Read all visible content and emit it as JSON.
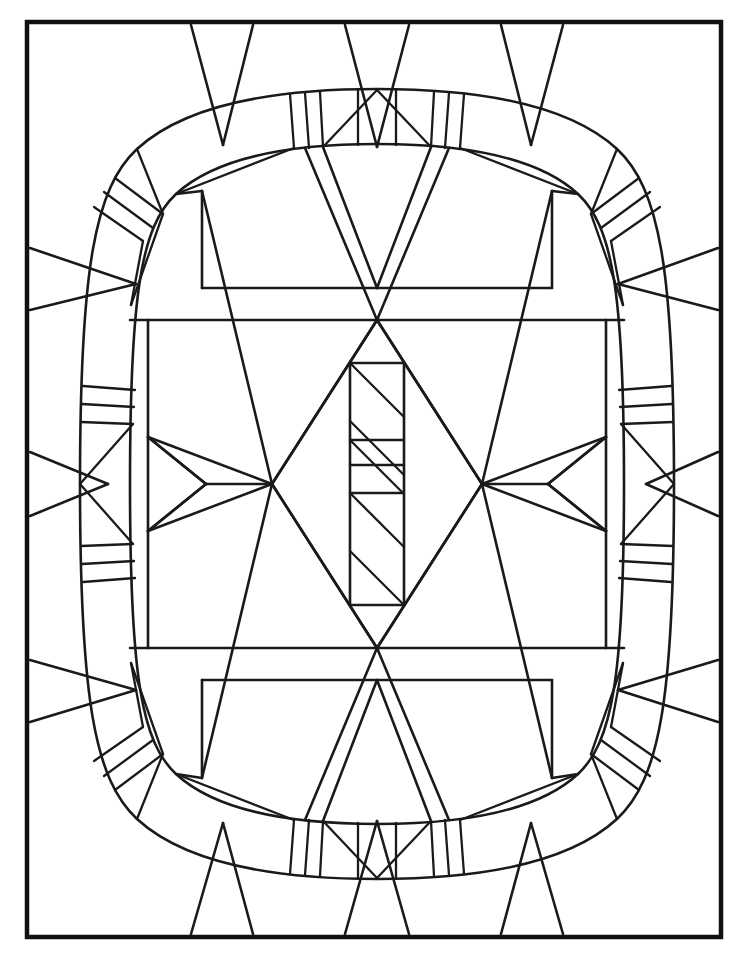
{
  "document": {
    "title": "Stained Glass Line-Art Coloring Page",
    "kind": "line-art-illustration",
    "background_color": "#ffffff",
    "line_color": "#1a1a1a",
    "frame_color": "#111111",
    "canvas": {
      "width": 742,
      "height": 956
    }
  },
  "frame": {
    "name": "outer-rectangular-border",
    "x": 27,
    "y": 22,
    "width": 694,
    "height": 915,
    "stroke_width": 4.5
  },
  "composition": {
    "description": "Symmetric stained-glass panel: a rounded-rectangle (squircle) band ring fills most of the frame; inside it a large X/diamond lattice surrounds a central vertical rectangle filled with diagonal stripes. Small triangular wedges point inward from the outer frame edges.",
    "symmetry": "bilateral vertical and horizontal",
    "center": {
      "x": 377,
      "y": 484
    }
  },
  "ring": {
    "name": "squircle-band-ring",
    "outer": {
      "cx": 377,
      "cy": 484,
      "rx": 303,
      "ry": 395,
      "corner_roundness": 0.62
    },
    "inner": {
      "cx": 377,
      "cy": 484,
      "rx": 258,
      "ry": 348,
      "corner_roundness": 0.62
    },
    "segment_groups": [
      {
        "position": "top-center",
        "bars": 3,
        "orientation": "vertical"
      },
      {
        "position": "bottom-center",
        "bars": 3,
        "orientation": "vertical"
      },
      {
        "position": "left-center",
        "bars": 3,
        "orientation": "horizontal"
      },
      {
        "position": "right-center",
        "bars": 3,
        "orientation": "horizontal"
      },
      {
        "position": "top-left-corner",
        "bars": 2,
        "orientation": "diagonal"
      },
      {
        "position": "top-right-corner",
        "bars": 2,
        "orientation": "diagonal"
      },
      {
        "position": "bottom-left-corner",
        "bars": 2,
        "orientation": "diagonal"
      },
      {
        "position": "bottom-right-corner",
        "bars": 2,
        "orientation": "diagonal"
      }
    ]
  },
  "center_motif": {
    "name": "striped-central-rectangle",
    "rect": {
      "x": 350,
      "y": 363,
      "width": 54,
      "height": 242
    },
    "stripe_direction": "diagonal-down-right",
    "stripe_count": 6,
    "horizontal_dividers": 3,
    "surrounding_shape": "large-diamond"
  },
  "outer_wedges": {
    "top": 3,
    "bottom": 3,
    "left": 3,
    "right": 3,
    "shape": "triangle",
    "points": "inward"
  },
  "bands": {
    "upper_horizontal_band": {
      "y_top": 288,
      "y_bottom": 320
    },
    "lower_horizontal_band": {
      "y_top": 648,
      "y_bottom": 680
    }
  },
  "palette": {
    "paper": "#ffffff",
    "ink": "#1a1a1a",
    "frame": "#111111"
  }
}
